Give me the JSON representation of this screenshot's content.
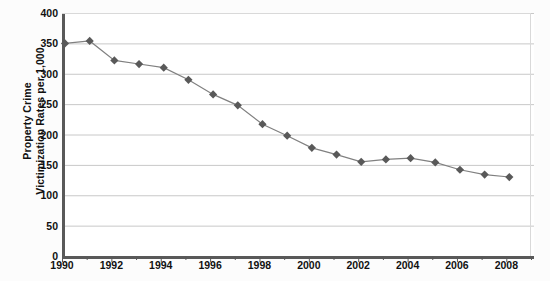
{
  "axes": {
    "y_title": "Property Crime\nVictimization Rates per 1,000",
    "y_ticks": [
      "400",
      "350",
      "300",
      "250",
      "200",
      "150",
      "100",
      "50",
      "0"
    ],
    "x_ticks": [
      "1990",
      "1992",
      "1994",
      "1996",
      "1998",
      "2000",
      "2002",
      "2004",
      "2006",
      "2008"
    ]
  },
  "style": {
    "marker_color": "#595959",
    "line_color": "#808080",
    "gridline_color": "#c8c8c8",
    "axis_color": "#595959",
    "plot_background": "#ffffff",
    "page_background": "#fbfbfb"
  },
  "chart_data": {
    "type": "line",
    "title": "",
    "subtitle": "",
    "xlabel": "",
    "ylabel": "Property Crime Victimization Rates per 1,000",
    "xlim": [
      1990,
      2009
    ],
    "ylim": [
      0,
      400
    ],
    "ytick_step": 50,
    "xtick_step": 2,
    "grid": true,
    "grid_axis": "y",
    "legend": false,
    "legend_position": "none",
    "marker": "diamond",
    "x": [
      1990,
      1991,
      1992,
      1993,
      1994,
      1995,
      1996,
      1997,
      1998,
      1999,
      2000,
      2001,
      2002,
      2003,
      2004,
      2005,
      2006,
      2007,
      2008
    ],
    "values": [
      350,
      354,
      322,
      316,
      310,
      290,
      266,
      248,
      217,
      198,
      178,
      167,
      155,
      159,
      161,
      154,
      142,
      134,
      130
    ],
    "series": [
      {
        "name": "Property Crime Victimization Rate",
        "values": [
          350,
          354,
          322,
          316,
          310,
          290,
          266,
          248,
          217,
          198,
          178,
          167,
          155,
          159,
          161,
          154,
          142,
          134,
          130
        ]
      }
    ],
    "annotations": []
  }
}
